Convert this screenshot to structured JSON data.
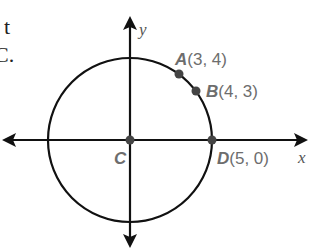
{
  "cropped_text": {
    "line1": "t",
    "line2": "C."
  },
  "axes": {
    "x_label": "x",
    "y_label": "y"
  },
  "circle": {
    "center_label": "C",
    "center": [
      0,
      0
    ],
    "radius": 5
  },
  "points": [
    {
      "letter": "A",
      "coords": "(3, 4)",
      "x": 3,
      "y": 4
    },
    {
      "letter": "B",
      "coords": "(4, 3)",
      "x": 4,
      "y": 3
    },
    {
      "letter": "C",
      "coords": "",
      "x": 0,
      "y": 0
    },
    {
      "letter": "D",
      "coords": "(5, 0)",
      "x": 5,
      "y": 0
    }
  ],
  "colors": {
    "line": "#111111",
    "point": "#444444",
    "label": "#6d6d6d"
  }
}
